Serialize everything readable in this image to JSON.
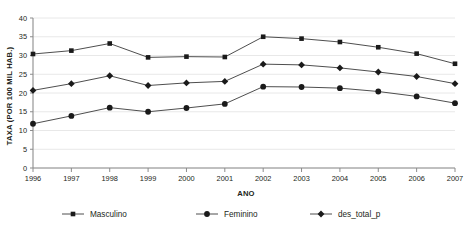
{
  "chart_data": {
    "type": "line",
    "title": "",
    "xlabel": "ANO",
    "ylabel": "TAXA (POR 100 MIL HAB.)",
    "categories": [
      "1996",
      "1997",
      "1998",
      "1999",
      "2000",
      "2001",
      "2002",
      "2003",
      "2004",
      "2005",
      "2006",
      "2007"
    ],
    "x": [
      1996,
      1997,
      1998,
      1999,
      2000,
      2001,
      2002,
      2003,
      2004,
      2005,
      2006,
      2007
    ],
    "series": [
      {
        "name": "Masculino",
        "marker": "square",
        "values": [
          30.4,
          31.3,
          33.2,
          29.5,
          29.7,
          29.6,
          35.0,
          34.5,
          33.6,
          32.2,
          30.5,
          27.8
        ]
      },
      {
        "name": "Feminino",
        "marker": "circle",
        "values": [
          11.8,
          13.9,
          16.1,
          15.0,
          16.0,
          17.1,
          21.7,
          21.6,
          21.3,
          20.4,
          19.1,
          17.3
        ]
      },
      {
        "name": "des_total_p",
        "marker": "diamond",
        "values": [
          20.7,
          22.5,
          24.6,
          22.0,
          22.7,
          23.1,
          27.7,
          27.5,
          26.7,
          25.6,
          24.4,
          22.5
        ]
      }
    ],
    "ylim": [
      0,
      40
    ],
    "y_ticks": [
      0,
      5,
      10,
      15,
      20,
      25,
      30,
      35,
      40
    ],
    "y_tick_labels": [
      "0",
      "5",
      "10",
      "15",
      "20",
      "25",
      "30",
      "35",
      "40"
    ],
    "grid": true,
    "grid_axis": "y",
    "legend_position": "bottom",
    "legend": [
      "Masculino",
      "Feminino",
      "des_total_p"
    ],
    "colors": {
      "line": "#3a3a3a",
      "marker": "#1a1a1a",
      "grid": "#e8e8e8",
      "axis": "#8c8c8c",
      "text": "#231f20",
      "background": "#ffffff"
    }
  }
}
